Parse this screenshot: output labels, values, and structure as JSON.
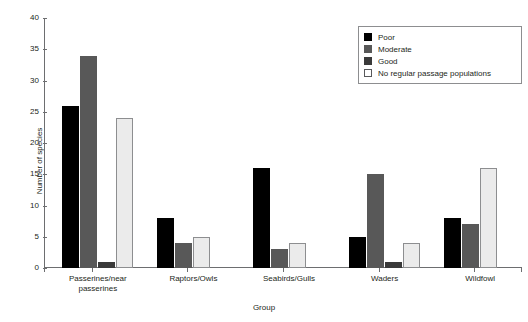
{
  "chart_data": {
    "type": "bar",
    "title": "",
    "xlabel": "Group",
    "ylabel": "Number of species",
    "ylim": [
      0,
      40
    ],
    "yticks": [
      0,
      5,
      10,
      15,
      20,
      25,
      30,
      35,
      40
    ],
    "grid": false,
    "legend_position": "top-right",
    "categories": [
      "Passerines/near passerines",
      "Raptors/Owls",
      "Seabirds/Gulls",
      "Waders",
      "Wildfowl"
    ],
    "series": [
      {
        "name": "Poor",
        "color": "#000000",
        "values": [
          26,
          8,
          16,
          5,
          8
        ]
      },
      {
        "name": "Moderate",
        "color": "#585858",
        "values": [
          34,
          4,
          3,
          15,
          7
        ]
      },
      {
        "name": "Good",
        "color": "#3a3a3a",
        "values": [
          1,
          0,
          0,
          1,
          0
        ]
      },
      {
        "name": "No regular passage populations",
        "color": "#ebebeb",
        "values": [
          24,
          5,
          4,
          4,
          16
        ]
      }
    ]
  },
  "legend": {
    "items": [
      {
        "label": "Poor"
      },
      {
        "label": "Moderate"
      },
      {
        "label": "Good"
      },
      {
        "label": "No regular passage populations"
      }
    ]
  }
}
